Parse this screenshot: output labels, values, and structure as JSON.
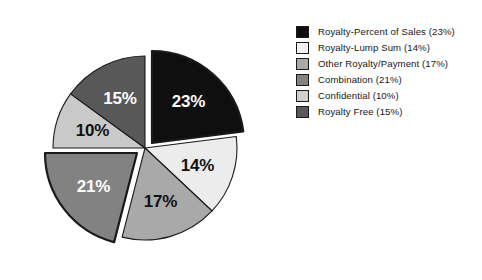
{
  "chart_data": {
    "type": "pie",
    "title": "",
    "subtitle": "",
    "xlabel": "",
    "ylabel": "",
    "units": "percent",
    "grid": false,
    "legend_position": "right",
    "start_angle_deg": 0,
    "direction": "clockwise",
    "categories": [
      "Royalty-Percent of Sales",
      "Royalty-Lump Sum",
      "Other Royalty/Payment",
      "Combination",
      "Confidential",
      "Royalty Free"
    ],
    "values": [
      23,
      14,
      17,
      21,
      10,
      15
    ],
    "slices": [
      {
        "name": "Royalty-Percent of Sales",
        "value": 23,
        "label": "23%",
        "legend_label": "Royalty-Percent of Sales (23%)",
        "color": "#100f0f",
        "label_color": "#ffffff",
        "exploded": true,
        "explode_dx": 7,
        "explode_dy": -5
      },
      {
        "name": "Royalty-Lump Sum",
        "value": 14,
        "label": "14%",
        "legend_label": "Royalty-Lump Sum (14%)",
        "color": "#ececec",
        "label_color": "#111111",
        "exploded": false,
        "explode_dx": 0,
        "explode_dy": 0
      },
      {
        "name": "Other Royalty/Payment",
        "value": 17,
        "label": "17%",
        "legend_label": "Other Royalty/Payment (17%)",
        "color": "#a9a9a9",
        "label_color": "#111111",
        "exploded": false,
        "explode_dx": 0,
        "explode_dy": 0
      },
      {
        "name": "Combination",
        "value": 21,
        "label": "21%",
        "legend_label": "Combination (21%)",
        "color": "#828282",
        "label_color": "#ffffff",
        "exploded": true,
        "explode_dx": -8,
        "explode_dy": 5
      },
      {
        "name": "Confidential",
        "value": 10,
        "label": "10%",
        "legend_label": "Confidential (10%)",
        "color": "#c9c9c9",
        "label_color": "#111111",
        "exploded": false,
        "explode_dx": 0,
        "explode_dy": 0
      },
      {
        "name": "Royalty Free",
        "value": 15,
        "label": "15%",
        "legend_label": "Royalty Free (15%)",
        "color": "#585858",
        "label_color": "#ffffff",
        "exploded": false,
        "explode_dx": 0,
        "explode_dy": 0
      }
    ]
  },
  "legend": {
    "items": [
      {
        "label": "Royalty-Percent of Sales (23%)",
        "color": "#100f0f"
      },
      {
        "label": "Royalty-Lump Sum (14%)",
        "color": "#f2f2f2"
      },
      {
        "label": "Other Royalty/Payment (17%)",
        "color": "#a9a9a9"
      },
      {
        "label": "Combination (21%)",
        "color": "#828282"
      },
      {
        "label": "Confidential (10%)",
        "color": "#cfcfcf"
      },
      {
        "label": "Royalty Free (15%)",
        "color": "#585858"
      }
    ]
  },
  "colors": {
    "background": "#ffffff",
    "outline": "#1a1a1a",
    "text": "#181818"
  }
}
